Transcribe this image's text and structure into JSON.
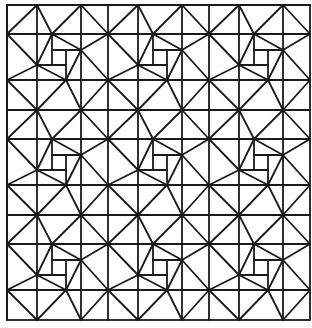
{
  "figure": {
    "stroke_color": "#1a1a1a",
    "background_color": "#ffffff",
    "stroke_width": 1.8
  },
  "grid": {
    "origin": [
      7,
      5
    ],
    "tile_size": [
      101,
      105
    ],
    "tiles_x": 3,
    "tiles_y": 3,
    "border": [
      7,
      5,
      310,
      320
    ]
  },
  "tile_segments": [
    [
      0,
      0,
      101,
      0
    ],
    [
      0,
      0,
      0,
      105
    ],
    [
      0,
      29,
      101,
      29
    ],
    [
      0,
      75,
      101,
      75
    ],
    [
      30,
      0,
      30,
      105
    ],
    [
      74,
      0,
      74,
      105
    ],
    [
      30,
      0,
      0,
      29
    ],
    [
      30,
      0,
      45,
      29
    ],
    [
      74,
      0,
      45,
      29
    ],
    [
      74,
      0,
      101,
      29
    ],
    [
      0,
      29,
      30,
      60
    ],
    [
      45,
      29,
      30,
      60
    ],
    [
      45,
      29,
      74,
      45
    ],
    [
      101,
      29,
      74,
      45
    ],
    [
      74,
      45,
      59,
      75
    ],
    [
      30,
      60,
      59,
      75
    ],
    [
      30,
      60,
      0,
      75
    ],
    [
      74,
      45,
      101,
      75
    ],
    [
      59,
      75,
      74,
      105
    ],
    [
      59,
      75,
      30,
      105
    ],
    [
      0,
      75,
      30,
      105
    ],
    [
      101,
      75,
      74,
      105
    ],
    [
      45,
      29,
      45,
      60
    ],
    [
      45,
      45,
      74,
      45
    ],
    [
      59,
      45,
      59,
      75
    ],
    [
      30,
      60,
      59,
      60
    ]
  ]
}
